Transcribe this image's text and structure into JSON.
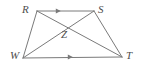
{
  "figure": {
    "background_color": "#ffffff",
    "stroke_color": "#7a7a7a",
    "label_color": "#4d4d4d",
    "stroke_width": 1,
    "points": {
      "R": {
        "x": 37,
        "y": 11,
        "label": "R",
        "label_x": 22,
        "label_y": 4
      },
      "S": {
        "x": 94,
        "y": 11,
        "label": "S",
        "label_x": 98,
        "label_y": 4
      },
      "W": {
        "x": 23,
        "y": 58,
        "label": "W",
        "label_x": 10,
        "label_y": 50
      },
      "T": {
        "x": 122,
        "y": 57,
        "label": "T",
        "label_x": 126,
        "label_y": 50
      },
      "Z": {
        "x": 67,
        "y": 26,
        "label": "Z",
        "label_x": 61,
        "label_y": 29
      }
    },
    "segments": [
      {
        "name": "RS",
        "from": "R",
        "to": "S",
        "x1": 37,
        "y1": 11,
        "x2": 94,
        "y2": 11
      },
      {
        "name": "RW",
        "from": "R",
        "to": "W",
        "x1": 37,
        "y1": 11,
        "x2": 23,
        "y2": 58
      },
      {
        "name": "ST",
        "from": "S",
        "to": "T",
        "x1": 94,
        "y1": 11,
        "x2": 122,
        "y2": 57
      },
      {
        "name": "WT",
        "from": "W",
        "to": "T",
        "x1": 23,
        "y1": 58,
        "x2": 122,
        "y2": 57
      },
      {
        "name": "RT",
        "from": "R",
        "to": "T",
        "x1": 37,
        "y1": 11,
        "x2": 122,
        "y2": 57
      },
      {
        "name": "WS",
        "from": "W",
        "to": "S",
        "x1": 23,
        "y1": 58,
        "x2": 94,
        "y2": 11
      }
    ],
    "tick_marks": [
      {
        "name": "arrow-on-RS",
        "segment": "RS",
        "x": 60,
        "y": 11,
        "direction": "right",
        "count": 1
      },
      {
        "name": "arrow-on-WT",
        "segment": "WT",
        "x": 72,
        "y": 57,
        "direction": "right",
        "count": 1
      }
    ],
    "parallel_pairs": [
      [
        "RS",
        "WT"
      ]
    ]
  }
}
